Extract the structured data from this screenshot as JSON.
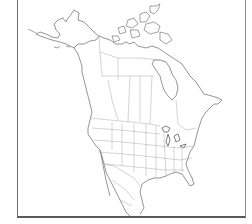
{
  "map": {
    "title": "",
    "region": "North America",
    "style": "blank outline map",
    "show_state_borders": true,
    "show_province_borders": true,
    "labels": [],
    "colors": {
      "background": "#ffffff",
      "coastline": "#7a7a7a",
      "borders": "#a8a8a8",
      "frame": "#6e6e6e"
    }
  }
}
